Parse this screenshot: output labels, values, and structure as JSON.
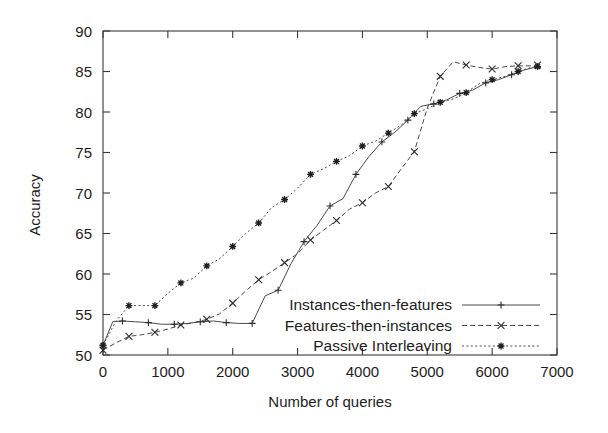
{
  "chart_data": {
    "type": "line",
    "title": "",
    "xlabel": "Number of queries",
    "ylabel": "Accuracy",
    "xlim": [
      0,
      7000
    ],
    "ylim": [
      50,
      90
    ],
    "xticks": [
      0,
      1000,
      2000,
      3000,
      4000,
      5000,
      6000,
      7000
    ],
    "yticks": [
      50,
      55,
      60,
      65,
      70,
      75,
      80,
      85,
      90
    ],
    "grid": false,
    "legend_position": "bottom-right",
    "series": [
      {
        "name": "Instances-then-features",
        "marker": "plus",
        "linestyle": "solid",
        "color": "#4b4b4b",
        "points": [
          [
            0,
            51.2
          ],
          [
            150,
            54.1
          ],
          [
            300,
            54.2
          ],
          [
            500,
            54.1
          ],
          [
            700,
            54.0
          ],
          [
            900,
            53.8
          ],
          [
            1100,
            53.8
          ],
          [
            1300,
            53.9
          ],
          [
            1500,
            54.1
          ],
          [
            1700,
            54.2
          ],
          [
            1900,
            54.0
          ],
          [
            2100,
            53.9
          ],
          [
            2300,
            53.9
          ],
          [
            2500,
            57.3
          ],
          [
            2700,
            58.0
          ],
          [
            2900,
            61.3
          ],
          [
            3100,
            64.0
          ],
          [
            3300,
            66.0
          ],
          [
            3500,
            68.4
          ],
          [
            3700,
            69.3
          ],
          [
            3900,
            72.3
          ],
          [
            4100,
            74.5
          ],
          [
            4300,
            76.3
          ],
          [
            4500,
            77.5
          ],
          [
            4700,
            79.0
          ],
          [
            4900,
            80.7
          ],
          [
            5100,
            81.0
          ],
          [
            5300,
            81.5
          ],
          [
            5500,
            82.3
          ],
          [
            5700,
            82.7
          ],
          [
            5900,
            83.6
          ],
          [
            6100,
            84.0
          ],
          [
            6300,
            84.6
          ],
          [
            6500,
            85.2
          ],
          [
            6700,
            85.6
          ]
        ]
      },
      {
        "name": "Features-then-instances",
        "marker": "x",
        "linestyle": "dashed",
        "color": "#5a5a5a",
        "points": [
          [
            0,
            50.6
          ],
          [
            200,
            51.5
          ],
          [
            400,
            52.3
          ],
          [
            600,
            52.5
          ],
          [
            800,
            52.8
          ],
          [
            1000,
            53.2
          ],
          [
            1200,
            53.7
          ],
          [
            1400,
            54.0
          ],
          [
            1600,
            54.4
          ],
          [
            1800,
            55.1
          ],
          [
            2000,
            56.4
          ],
          [
            2200,
            57.9
          ],
          [
            2400,
            59.3
          ],
          [
            2600,
            60.3
          ],
          [
            2800,
            61.4
          ],
          [
            3000,
            62.5
          ],
          [
            3200,
            64.2
          ],
          [
            3400,
            65.4
          ],
          [
            3600,
            66.6
          ],
          [
            3800,
            68.0
          ],
          [
            4000,
            68.8
          ],
          [
            4200,
            70.0
          ],
          [
            4400,
            70.8
          ],
          [
            4600,
            73.0
          ],
          [
            4800,
            75.1
          ],
          [
            5000,
            80.5
          ],
          [
            5200,
            84.4
          ],
          [
            5400,
            86.2
          ],
          [
            5600,
            85.8
          ],
          [
            5800,
            85.5
          ],
          [
            6000,
            85.3
          ],
          [
            6200,
            85.6
          ],
          [
            6400,
            85.7
          ],
          [
            6600,
            85.7
          ],
          [
            6700,
            85.8
          ]
        ]
      },
      {
        "name": "Passive Interleaving",
        "marker": "star",
        "linestyle": "dotted",
        "color": "#3f3f3f",
        "points": [
          [
            0,
            51.2
          ],
          [
            200,
            54.2
          ],
          [
            400,
            56.1
          ],
          [
            600,
            56.1
          ],
          [
            800,
            56.1
          ],
          [
            1000,
            57.6
          ],
          [
            1200,
            58.9
          ],
          [
            1400,
            59.5
          ],
          [
            1600,
            61.0
          ],
          [
            1800,
            61.9
          ],
          [
            2000,
            63.4
          ],
          [
            2200,
            65.0
          ],
          [
            2400,
            66.3
          ],
          [
            2600,
            68.2
          ],
          [
            2800,
            69.2
          ],
          [
            3000,
            70.6
          ],
          [
            3200,
            72.3
          ],
          [
            3400,
            73.0
          ],
          [
            3600,
            73.9
          ],
          [
            3800,
            74.6
          ],
          [
            4000,
            75.8
          ],
          [
            4200,
            76.4
          ],
          [
            4400,
            77.4
          ],
          [
            4600,
            78.4
          ],
          [
            4800,
            79.8
          ],
          [
            5000,
            80.4
          ],
          [
            5200,
            81.2
          ],
          [
            5400,
            81.6
          ],
          [
            5600,
            82.4
          ],
          [
            5800,
            83.5
          ],
          [
            6000,
            84.0
          ],
          [
            6200,
            84.4
          ],
          [
            6400,
            85.0
          ],
          [
            6600,
            85.5
          ],
          [
            6700,
            85.6
          ]
        ]
      }
    ]
  },
  "legend": {
    "items": [
      {
        "label": "Instances-then-features"
      },
      {
        "label": "Features-then-instances"
      },
      {
        "label": "Passive Interleaving"
      }
    ]
  }
}
